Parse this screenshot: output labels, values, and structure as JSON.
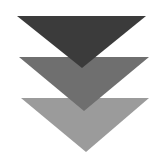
{
  "graphic": {
    "description": "Three stacked downward-pointing triangles (chevron-style stack)",
    "triangles": [
      {
        "name": "top",
        "color": "#3b3b3b",
        "points": "17,16 146,16 82,68"
      },
      {
        "name": "middle",
        "color": "#6f6f6f",
        "points": "19,57 149,57 84,111"
      },
      {
        "name": "bottom",
        "color": "#9b9b9b",
        "points": "21,98 149,98 86,152"
      }
    ]
  }
}
